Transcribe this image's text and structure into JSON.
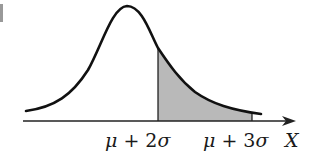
{
  "diagram": {
    "type": "normal-distribution-tail-area",
    "curve": "bell curve (skewed right tail)",
    "shaded_region": {
      "from": "μ + 2σ",
      "to": "μ + 3σ",
      "fill": "#b9b9b9"
    },
    "labels": {
      "left_tick": {
        "mu": "μ",
        "op": " + ",
        "coef": "2",
        "sigma": "σ"
      },
      "right_tick": {
        "mu": "μ",
        "op": " + ",
        "coef": "3",
        "sigma": "σ"
      },
      "axis": "X"
    },
    "colors": {
      "stroke": "#111111",
      "shade": "#b9b9b9",
      "background": "#ffffff"
    }
  }
}
